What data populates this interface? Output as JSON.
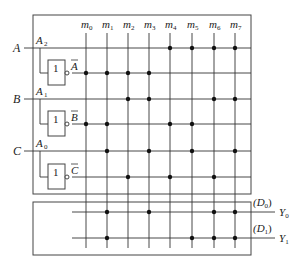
{
  "diagram": {
    "type": "PLA decoder array",
    "inputs": [
      {
        "name": "A",
        "sub_label": "A",
        "sub_index": "2",
        "inverted_label": "A"
      },
      {
        "name": "B",
        "sub_label": "A",
        "sub_index": "1",
        "inverted_label": "B"
      },
      {
        "name": "C",
        "sub_label": "A",
        "sub_index": "0",
        "inverted_label": "C"
      }
    ],
    "gate_label": "1",
    "minterms": [
      {
        "base": "m",
        "index": "0"
      },
      {
        "base": "m",
        "index": "1"
      },
      {
        "base": "m",
        "index": "2"
      },
      {
        "base": "m",
        "index": "3"
      },
      {
        "base": "m",
        "index": "4"
      },
      {
        "base": "m",
        "index": "5"
      },
      {
        "base": "m",
        "index": "6"
      },
      {
        "base": "m",
        "index": "7"
      }
    ],
    "and_rows": [
      {
        "signal": "A",
        "connections": [
          4,
          5,
          6,
          7
        ]
      },
      {
        "signal": "A_bar",
        "connections": [
          0,
          1,
          2,
          3
        ]
      },
      {
        "signal": "B",
        "connections": [
          2,
          3,
          6,
          7
        ]
      },
      {
        "signal": "B_bar",
        "connections": [
          0,
          1,
          4,
          5
        ]
      },
      {
        "signal": "C",
        "connections": [
          1,
          3,
          5,
          7
        ]
      },
      {
        "signal": "C_bar",
        "connections": [
          2,
          4,
          6
        ]
      }
    ],
    "outputs": [
      {
        "data_label": "(D",
        "data_index": "0",
        "data_close": ")",
        "name": "Y",
        "index": "0",
        "connections": [
          1,
          3,
          6,
          7
        ]
      },
      {
        "data_label": "(D",
        "data_index": "1",
        "data_close": ")",
        "name": "Y",
        "index": "1",
        "connections": [
          1,
          5,
          6,
          7
        ]
      }
    ]
  }
}
